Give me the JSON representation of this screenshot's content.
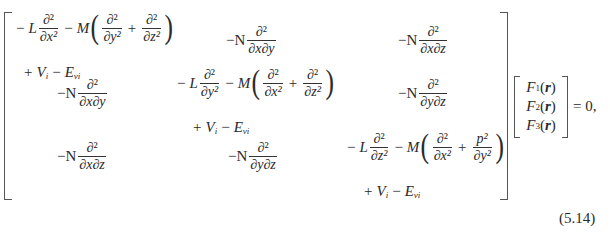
{
  "equation": {
    "number": "(5.14)",
    "rhs": "= 0,",
    "matrix": [
      [
        {
          "coef": "L",
          "d": "∂²",
          "diag_den": "∂x²",
          "m": "M",
          "p1_den": "∂y²",
          "p2_num": "∂²",
          "p2_den": "∂z²",
          "tail_v": "V",
          "tail_v_sub": "i",
          "tail_e": "E",
          "tail_e_sub": "vi"
        },
        {
          "prefix": "−N",
          "num": "∂²",
          "den": "∂x∂y"
        },
        {
          "prefix": "−N",
          "num": "∂²",
          "den": "∂x∂z"
        }
      ],
      [
        {
          "prefix": "−N",
          "num": "∂²",
          "den": "∂x∂y"
        },
        {
          "coef": "L",
          "d": "∂²",
          "diag_den": "∂y²",
          "m": "M",
          "p1_den": "∂x²",
          "p2_num": "∂²",
          "p2_den": "∂z²",
          "tail_v": "V",
          "tail_v_sub": "i",
          "tail_e": "E",
          "tail_e_sub": "vi"
        },
        {
          "prefix": "−N",
          "num": "∂²",
          "den": "∂y∂z"
        }
      ],
      [
        {
          "prefix": "−N",
          "num": "∂²",
          "den": "∂x∂z"
        },
        {
          "prefix": "−N",
          "num": "∂²",
          "den": "∂y∂z"
        },
        {
          "coef": "L",
          "d": "∂²",
          "diag_den": "∂z²",
          "m": "M",
          "p1_den": "∂x²",
          "p2_num": "p²",
          "p2_den": "∂y²",
          "tail_v": "V",
          "tail_v_sub": "i",
          "tail_e": "E",
          "tail_e_sub": "vi"
        }
      ]
    ],
    "vector": [
      {
        "f": "F",
        "sub": "1",
        "arg": "r"
      },
      {
        "f": "F",
        "sub": "2",
        "arg": "r"
      },
      {
        "f": "F",
        "sub": "3",
        "arg": "r"
      }
    ],
    "symbols": {
      "minus": "−",
      "plus": "+",
      "lparen": "(",
      "rparen": ")",
      "open": "(",
      "close": ")"
    }
  }
}
